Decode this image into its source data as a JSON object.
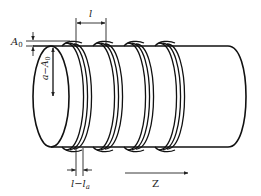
{
  "figure": {
    "ring_count": 4,
    "labels": {
      "amplitude": "A",
      "amplitude_sub": "0",
      "radius_minus_amp_main": "a−A",
      "radius_minus_amp_sub": "0",
      "period": "l",
      "gap_main": "l−l",
      "gap_sub": "a",
      "axis": "Z"
    }
  }
}
